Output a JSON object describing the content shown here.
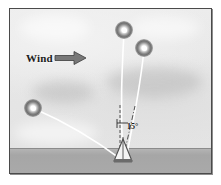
{
  "figure": {
    "kind": "technical-illustration",
    "frame_color": "#4a4a4a",
    "sky_color": "#e9e9e9",
    "ground_color": "#a8a8a8",
    "tether_color": "#ffffff",
    "annotation_color": "#1b1b1b"
  },
  "wind": {
    "label": "Wind",
    "direction": "right",
    "arrow_color": "#6e6e6e"
  },
  "angle": {
    "value": "15",
    "unit": "°",
    "label": "15°",
    "reference": "vertical"
  },
  "balloons": [
    {
      "name": "balloon-upper-left",
      "x": 114,
      "y": 21,
      "glow": "#7a7a7a",
      "core": "#ffffff"
    },
    {
      "name": "balloon-upper-right",
      "x": 134,
      "y": 39,
      "glow": "#7a7a7a",
      "core": "#ffffff"
    },
    {
      "name": "balloon-lower-left",
      "x": 23,
      "y": 99,
      "glow": "#7a7a7a",
      "core": "#ffffff"
    }
  ],
  "tethers": [
    {
      "name": "tether-upper-left",
      "path": "M 114 23 C 112 60, 110 100, 113 150"
    },
    {
      "name": "tether-upper-right",
      "path": "M 134 41 C 131 70, 124 110, 116 150"
    },
    {
      "name": "tether-lower-left",
      "path": "M 25 100 C 55 113, 88 133, 112 151"
    }
  ],
  "mast": {
    "name": "mast-tower",
    "base_x": 113,
    "base_y": 152,
    "apex_y": 130,
    "half_width": 8,
    "color": "#5c5c5c"
  },
  "reference_line": {
    "name": "vertical-reference",
    "x": 110,
    "top": 96,
    "bottom": 148,
    "style": "dashed"
  },
  "angle_arm": {
    "name": "deflected-arm",
    "x1": 113,
    "y1": 150,
    "x2": 124,
    "y2": 98,
    "style": "dash-dot"
  },
  "clouds": [
    {
      "left": 10,
      "top": 6,
      "width": 70,
      "height": 26,
      "dark": false
    },
    {
      "left": 96,
      "top": 58,
      "width": 96,
      "height": 30,
      "dark": true
    },
    {
      "left": 22,
      "top": 72,
      "width": 62,
      "height": 22,
      "dark": true
    },
    {
      "left": 120,
      "top": 8,
      "width": 70,
      "height": 22,
      "dark": false
    },
    {
      "left": 4,
      "top": 112,
      "width": 84,
      "height": 24,
      "dark": false
    }
  ]
}
